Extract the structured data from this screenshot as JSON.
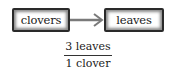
{
  "diagram": {
    "source_box": {
      "label": "clovers"
    },
    "target_box": {
      "label": "leaves"
    },
    "arrow": {
      "direction": "right",
      "color": "#808080"
    },
    "conversion_factor": {
      "numerator": "3 leaves",
      "denominator": "1 clover"
    }
  }
}
